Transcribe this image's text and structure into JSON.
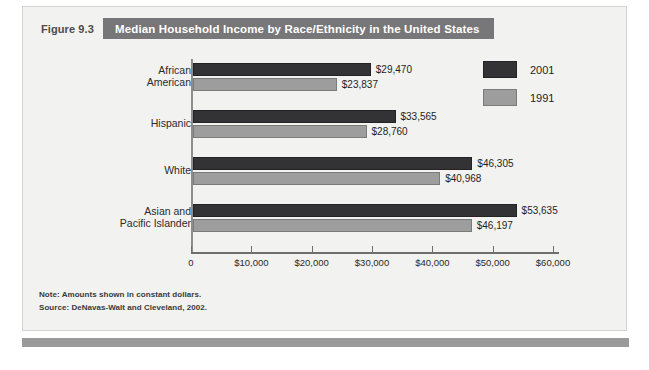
{
  "figure": {
    "label": "Figure 9.3",
    "title": "Median Household Income by Race/Ethnicity in the United States"
  },
  "notes": {
    "note": "Note: Amounts shown in constant dollars.",
    "source": "Source: DeNavas-Walt and Cleveland, 2002."
  },
  "colors": {
    "series_2001": "#333335",
    "series_1991": "#9d9d9d",
    "title_band": "#77777a",
    "panel_background": "#f2f2f0",
    "bottom_rule": "#9a9a9a"
  },
  "chart_data": {
    "type": "bar",
    "orientation": "horizontal",
    "title": "Median Household Income by Race/Ethnicity in the United States",
    "xlabel": "",
    "ylabel": "",
    "xlim": [
      0,
      60000
    ],
    "grid": false,
    "legend_position": "top-right",
    "tick_labels": [
      "0",
      "$10,000",
      "$20,000",
      "$30,000",
      "$40,000",
      "$50,000",
      "$60,000"
    ],
    "tick_values": [
      0,
      10000,
      20000,
      30000,
      40000,
      50000,
      60000
    ],
    "categories": [
      "African American",
      "Hispanic",
      "White",
      "Asian and Pacific Islander"
    ],
    "category_lines": [
      [
        "African",
        "American"
      ],
      [
        "Hispanic"
      ],
      [
        "White"
      ],
      [
        "Asian and",
        "Pacific Islander"
      ]
    ],
    "series": [
      {
        "name": "2001",
        "values": [
          29470,
          33565,
          46305,
          53635
        ],
        "labels": [
          "$29,470",
          "$33,565",
          "$46,305",
          "$53,635"
        ]
      },
      {
        "name": "1991",
        "values": [
          23837,
          28760,
          40968,
          46197
        ],
        "labels": [
          "$23,837",
          "$28,760",
          "$40,968",
          "$46,197"
        ]
      }
    ]
  }
}
